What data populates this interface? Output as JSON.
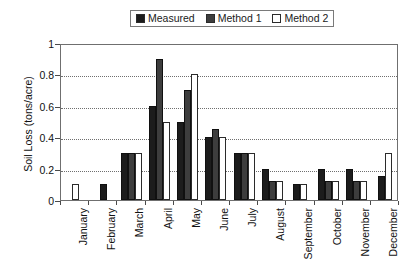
{
  "chart_data": {
    "type": "bar",
    "title": "",
    "xlabel": "",
    "ylabel": "Soil Loss (tons/acre)",
    "ylim": [
      0,
      1
    ],
    "yticks": [
      "0",
      "0.2",
      "0.4",
      "0.6",
      "0.8",
      "1"
    ],
    "grid": true,
    "legend_position": "top-center",
    "categories": [
      "January",
      "February",
      "March",
      "April",
      "May",
      "June",
      "July",
      "August",
      "September",
      "October",
      "November",
      "December"
    ],
    "series": [
      {
        "name": "Measured",
        "color": "#1c1c1c",
        "values": [
          0,
          0.1,
          0.3,
          0.6,
          0.5,
          0.4,
          0.3,
          0.2,
          0.1,
          0.2,
          0.2,
          0.15
        ]
      },
      {
        "name": "Method 1",
        "color": "#3d3d3d",
        "values": [
          0,
          0,
          0.3,
          0.9,
          0.7,
          0.45,
          0.3,
          0.12,
          0,
          0.12,
          0.12,
          0
        ]
      },
      {
        "name": "Method 2",
        "color": "#ffffff",
        "values": [
          0.1,
          0,
          0.3,
          0.5,
          0.8,
          0.4,
          0.3,
          0.12,
          0.1,
          0.12,
          0.12,
          0.3
        ]
      }
    ]
  },
  "legend": {
    "items": [
      {
        "label": "Measured"
      },
      {
        "label": "Method 1"
      },
      {
        "label": "Method 2"
      }
    ]
  },
  "axes": {
    "y_title": "Soil Loss (tons/acre)"
  }
}
